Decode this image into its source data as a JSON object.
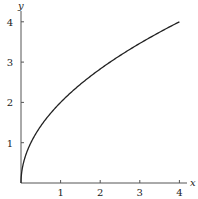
{
  "chart_data": {
    "type": "line",
    "title": "",
    "xlabel": "x",
    "ylabel": "y",
    "xlim": [
      0,
      4
    ],
    "ylim": [
      0,
      4
    ],
    "x_ticks": [
      "1",
      "2",
      "3",
      "4"
    ],
    "y_ticks": [
      "1",
      "2",
      "3",
      "4"
    ],
    "grid": false,
    "legend": null,
    "series": [
      {
        "name": "y = 2√x",
        "x": [
          0,
          0.0625,
          0.25,
          0.5,
          1,
          1.5,
          2,
          2.5,
          3,
          3.5,
          4
        ],
        "y": [
          0,
          0.5,
          1,
          1.414,
          2,
          2.449,
          2.828,
          3.162,
          3.464,
          3.742,
          4
        ],
        "color": "#222222"
      }
    ]
  }
}
